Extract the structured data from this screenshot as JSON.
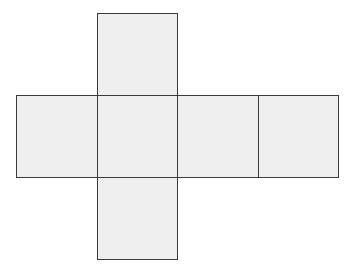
{
  "diagram": {
    "type": "cube-net",
    "colors": {
      "fill": "#efefef",
      "stroke": "#3a3a3a",
      "background": "#ffffff"
    },
    "faces": [
      {
        "id": "top",
        "x": 97,
        "y": 13,
        "w": 81,
        "h": 83
      },
      {
        "id": "left",
        "x": 16,
        "y": 95,
        "w": 82,
        "h": 83
      },
      {
        "id": "front",
        "x": 97,
        "y": 95,
        "w": 81,
        "h": 83
      },
      {
        "id": "right",
        "x": 177,
        "y": 95,
        "w": 82,
        "h": 83
      },
      {
        "id": "back",
        "x": 258,
        "y": 95,
        "w": 81,
        "h": 83
      },
      {
        "id": "bottom",
        "x": 97,
        "y": 177,
        "w": 81,
        "h": 83
      }
    ]
  }
}
